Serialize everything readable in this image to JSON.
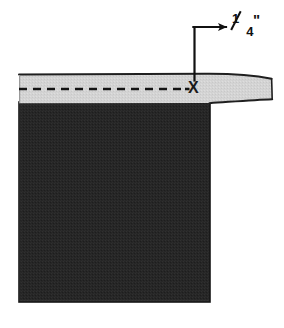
{
  "figure": {
    "annotation": {
      "measurement_label": "1/4\"",
      "numerator": "1",
      "denominator": "4",
      "inch_symbol": "\"",
      "mark_label": "X"
    },
    "colors": {
      "fabric_dark": "#262626",
      "binding_light": "#d2d2d2",
      "outline": "#1a1a1a",
      "stitch_dash": "#141414",
      "background": "#ffffff"
    },
    "geometry": {
      "fabric_left": 19,
      "fabric_right": 210,
      "fabric_top": 105,
      "fabric_bottom": 302,
      "band_top": 75,
      "band_bottom": 103,
      "band_right_tip": 272,
      "dash_y": 89,
      "dash_start_x": 19,
      "dash_end_x": 186,
      "leader_vertical_x": 194,
      "leader_vertical_top": 27,
      "leader_vertical_bottom": 80,
      "leader_arrow_x": 230,
      "leader_arrow_y": 27
    }
  }
}
